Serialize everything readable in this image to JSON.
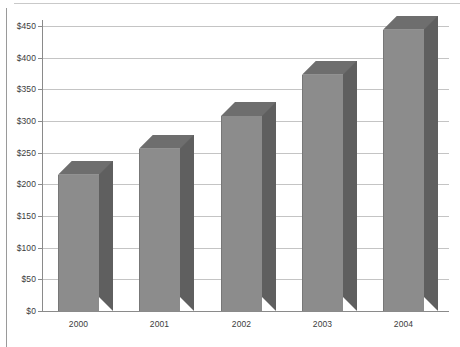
{
  "chart_data": {
    "type": "bar",
    "title": "",
    "subtitle": "",
    "xlabel": "",
    "ylabel": "",
    "categories": [
      "2000",
      "2001",
      "2002",
      "2003",
      "2004"
    ],
    "values": [
      215,
      256,
      308,
      373,
      444
    ],
    "series": [
      {
        "name": "",
        "values": [
          215,
          256,
          308,
          373,
          444
        ]
      }
    ],
    "ylim": [
      0,
      450
    ],
    "ytick_step": 50,
    "ytick_labels": [
      "$0",
      "$50",
      "$100",
      "$150",
      "$200",
      "$250",
      "$300",
      "$350",
      "$400",
      "$450"
    ],
    "ytick_values": [
      0,
      50,
      100,
      150,
      200,
      250,
      300,
      350,
      400,
      450
    ],
    "xtick_labels": [
      "2000",
      "2001",
      "2002",
      "2003",
      "2004"
    ],
    "grid": true,
    "grid_axis": "y",
    "legend": false,
    "legend_position": "none",
    "style": "3d-column",
    "annotations": [],
    "colors": {
      "bar_front": "#8c8c8c",
      "bar_side": "#5f5f5f",
      "bar_top": "#6e6e6e",
      "gridline": "#c4c4c4",
      "axis": "#8a8a8a",
      "text": "#3b3b3b",
      "background": "#ffffff"
    }
  }
}
